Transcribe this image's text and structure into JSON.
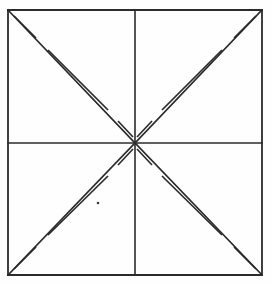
{
  "figure": {
    "type": "line-drawing",
    "canvas": {
      "width": 272,
      "height": 284
    },
    "background_color": "#fefefe",
    "stroke_color": "#2b2b2b",
    "stroke_width": 1.6,
    "square": {
      "left": 8,
      "top": 10,
      "right": 262,
      "bottom": 275,
      "width": 254,
      "height": 265
    },
    "center": {
      "x": 135,
      "y": 143
    },
    "midlines": {
      "horizontal": {
        "x1": 8,
        "y1": 143,
        "x2": 262,
        "y2": 143
      },
      "vertical": {
        "x1": 135,
        "y1": 10,
        "x2": 135,
        "y2": 275
      }
    },
    "border_segments": [
      {
        "name": "top-edge",
        "x1": 8,
        "y1": 10,
        "x2": 262,
        "y2": 10
      },
      {
        "name": "right-edge",
        "x1": 262,
        "y1": 10,
        "x2": 262,
        "y2": 275
      },
      {
        "name": "bottom-edge",
        "x1": 262,
        "y1": 275,
        "x2": 8,
        "y2": 275
      },
      {
        "name": "left-edge",
        "x1": 8,
        "y1": 275,
        "x2": 8,
        "y2": 10
      }
    ],
    "main_diagonals": [
      {
        "name": "diagonal-tl-center",
        "x1": 8,
        "y1": 10,
        "x2": 135,
        "y2": 143
      },
      {
        "name": "diagonal-tr-center",
        "x1": 262,
        "y1": 10,
        "x2": 135,
        "y2": 143
      },
      {
        "name": "diagonal-bl-center",
        "x1": 8,
        "y1": 275,
        "x2": 135,
        "y2": 143
      },
      {
        "name": "diagonal-br-center",
        "x1": 262,
        "y1": 275,
        "x2": 135,
        "y2": 143
      }
    ],
    "broken_antidiagonals": [
      {
        "name": "antidiagonal-quadrant-tl",
        "quadrant": "top-left",
        "segments": [
          {
            "x1": 14,
            "y1": 16,
            "x2": 36,
            "y2": 38
          },
          {
            "x1": 48,
            "y1": 50,
            "x2": 108,
            "y2": 110
          },
          {
            "x1": 118,
            "y1": 121,
            "x2": 133,
            "y2": 137
          }
        ]
      },
      {
        "name": "antidiagonal-quadrant-tr",
        "quadrant": "top-right",
        "segments": [
          {
            "x1": 256,
            "y1": 16,
            "x2": 234,
            "y2": 38
          },
          {
            "x1": 222,
            "y1": 50,
            "x2": 162,
            "y2": 110
          },
          {
            "x1": 152,
            "y1": 121,
            "x2": 137,
            "y2": 137
          }
        ]
      },
      {
        "name": "antidiagonal-quadrant-bl",
        "quadrant": "bottom-left",
        "segments": [
          {
            "x1": 14,
            "y1": 269,
            "x2": 36,
            "y2": 247
          },
          {
            "x1": 48,
            "y1": 235,
            "x2": 108,
            "y2": 176
          },
          {
            "x1": 118,
            "y1": 165,
            "x2": 133,
            "y2": 149
          }
        ]
      },
      {
        "name": "antidiagonal-quadrant-br",
        "quadrant": "bottom-right",
        "segments": [
          {
            "x1": 256,
            "y1": 269,
            "x2": 234,
            "y2": 247
          },
          {
            "x1": 222,
            "y1": 235,
            "x2": 162,
            "y2": 176
          },
          {
            "x1": 152,
            "y1": 165,
            "x2": 137,
            "y2": 149
          }
        ]
      }
    ],
    "artifacts": [
      {
        "name": "speck-dot",
        "cx": 98,
        "cy": 203,
        "r": 1.3
      }
    ]
  }
}
